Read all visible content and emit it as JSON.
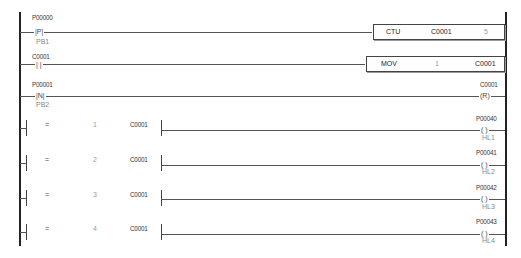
{
  "rungs": [
    {
      "contact": {
        "address": "P00000",
        "symbol": "|P|",
        "comment": "PB1"
      },
      "function_block": {
        "instruction": "CTU",
        "operand1": "C0001",
        "operand2": "5"
      }
    },
    {
      "contact": {
        "address": "C0001",
        "symbol": "| |"
      },
      "function_block": {
        "instruction": "MOV",
        "operand1": "1",
        "operand2": "C0001"
      }
    },
    {
      "contact": {
        "address": "P00001",
        "symbol": "|N|",
        "comment": "PB2"
      },
      "coil": {
        "address": "C0001",
        "symbol": "(R)"
      }
    },
    {
      "compare": {
        "operator": "=",
        "value": "1",
        "operand": "C0001"
      },
      "coil": {
        "address": "P00040",
        "symbol": "( )",
        "comment": "HL1"
      }
    },
    {
      "compare": {
        "operator": "=",
        "value": "2",
        "operand": "C0001"
      },
      "coil": {
        "address": "P00041",
        "symbol": "( )",
        "comment": "HL2"
      }
    },
    {
      "compare": {
        "operator": "=",
        "value": "3",
        "operand": "C0001"
      },
      "coil": {
        "address": "P00042",
        "symbol": "( )",
        "comment": "HL3"
      }
    },
    {
      "compare": {
        "operator": "=",
        "value": "4",
        "operand": "C0001"
      },
      "coil": {
        "address": "P00043",
        "symbol": "( )",
        "comment": "HL4"
      }
    }
  ]
}
